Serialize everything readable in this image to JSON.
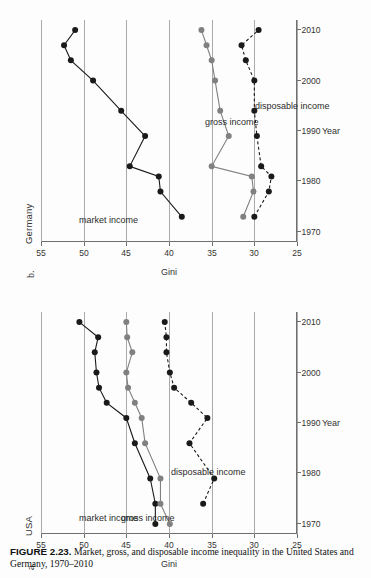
{
  "figure": {
    "number": "FIGURE 2.23.",
    "caption": "Market, gross, and disposable income inequality in the United States and Germany, 1970–2010"
  },
  "panels": [
    {
      "letter": "a.",
      "title": "USA"
    },
    {
      "letter": "b.",
      "title": "Germany"
    }
  ],
  "axes": {
    "ylabel": "Gini",
    "xlabel": "Year",
    "yticks": [
      "55",
      "50",
      "45",
      "40",
      "35",
      "30",
      "25"
    ],
    "xticks": [
      "1970",
      "1980",
      "1990",
      "2000",
      "2010"
    ]
  },
  "series_labels": {
    "market": "market income",
    "gross": "gross income",
    "disposable": "disposable income"
  },
  "colors": {
    "market": "#1a1a1a",
    "gross": "#808080",
    "disposable": "#1a1a1a",
    "grid": "#9b9b9b",
    "axis": "#6f6f6f"
  },
  "chart_data": [
    {
      "type": "line",
      "title": "USA",
      "panel": "a.",
      "xlabel": "Year",
      "ylabel": "Gini",
      "xlim": [
        1968,
        2012
      ],
      "ylim": [
        25,
        55
      ],
      "yticks": [
        55,
        50,
        45,
        40,
        35,
        30,
        25
      ],
      "xticks": [
        1970,
        1980,
        1990,
        2000,
        2010
      ],
      "grid": "horizontal",
      "legend": "inline-labels",
      "series": [
        {
          "name": "market income",
          "style": "solid",
          "color": "#1a1a1a",
          "x": [
            1970,
            1974,
            1979,
            1986,
            1991,
            1994,
            1997,
            2000,
            2004,
            2007,
            2010
          ],
          "y": [
            41.6,
            41.6,
            42.2,
            44.0,
            45.0,
            47.3,
            48.2,
            48.5,
            48.7,
            48.3,
            50.5
          ]
        },
        {
          "name": "gross income",
          "style": "solid",
          "color": "#808080",
          "x": [
            1970,
            1974,
            1979,
            1986,
            1991,
            1994,
            1997,
            2000,
            2004,
            2007,
            2010
          ],
          "y": [
            39.9,
            41.0,
            41.0,
            42.8,
            43.2,
            44.0,
            44.8,
            45.0,
            44.3,
            44.9,
            45.0
          ]
        },
        {
          "name": "disposable income",
          "style": "dashed",
          "color": "#1a1a1a",
          "x": [
            1974,
            1979,
            1986,
            1991,
            1994,
            1997,
            2000,
            2004,
            2007,
            2010
          ],
          "y": [
            36.0,
            34.7,
            37.6,
            35.5,
            37.4,
            39.4,
            39.9,
            40.3,
            40.3,
            40.5
          ]
        }
      ]
    },
    {
      "type": "line",
      "title": "Germany",
      "panel": "b.",
      "xlabel": "Year",
      "ylabel": "Gini",
      "xlim": [
        1968,
        2012
      ],
      "ylim": [
        25,
        55
      ],
      "yticks": [
        55,
        50,
        45,
        40,
        35,
        30,
        25
      ],
      "xticks": [
        1970,
        1980,
        1990,
        2000,
        2010
      ],
      "grid": "horizontal",
      "legend": "inline-labels",
      "series": [
        {
          "name": "market income",
          "style": "solid",
          "color": "#1a1a1a",
          "x": [
            1973,
            1978,
            1981,
            1983,
            1989,
            1994,
            2000,
            2004,
            2007,
            2010
          ],
          "y": [
            38.5,
            41.0,
            41.2,
            44.6,
            42.8,
            45.6,
            48.9,
            51.5,
            52.3,
            51.0
          ]
        },
        {
          "name": "gross income",
          "style": "solid",
          "color": "#808080",
          "x": [
            1973,
            1978,
            1981,
            1983,
            1989,
            1994,
            2000,
            2004,
            2007,
            2010
          ],
          "y": [
            31.3,
            30.1,
            30.3,
            35.0,
            33.0,
            34.0,
            34.6,
            35.0,
            35.6,
            36.2
          ]
        },
        {
          "name": "disposable income",
          "style": "dashed",
          "color": "#1a1a1a",
          "x": [
            1973,
            1978,
            1981,
            1983,
            1989,
            1994,
            2000,
            2004,
            2007,
            2010
          ],
          "y": [
            30.0,
            28.3,
            28.0,
            29.2,
            29.7,
            30.0,
            30.0,
            31.0,
            31.5,
            29.5
          ]
        }
      ]
    }
  ]
}
